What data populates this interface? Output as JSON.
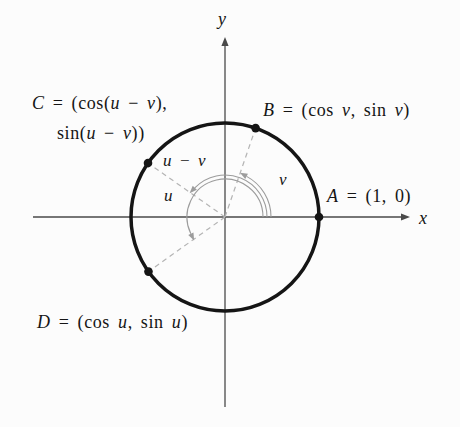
{
  "figure": {
    "colors": {
      "background": "#fcfcfc",
      "ink": "#151515",
      "axis": "#4a4a4a",
      "dash": "#b4b4b4",
      "arc": "#9c9c9c"
    },
    "geometry": {
      "cx": 225,
      "cy": 217,
      "radius": 94,
      "circle_stroke": 3.5,
      "dot_radius": 4.3,
      "axes": {
        "x_from": 33,
        "x_to": 410,
        "y_from": 407,
        "y_to": 37
      },
      "points": [
        {
          "name": "A",
          "angle_deg": 0
        },
        {
          "name": "B",
          "angle_deg": 71
        },
        {
          "name": "C",
          "angle_deg": 145
        },
        {
          "name": "D",
          "angle_deg": 215.5
        }
      ],
      "dashed_radii_deg": [
        71,
        145,
        215.5
      ],
      "arcs": [
        {
          "name": "angle-u-arc",
          "r": 38,
          "from_deg": 0,
          "to_deg": 206
        },
        {
          "name": "angle-u-minus-v-arc",
          "r": 42,
          "from_deg": 0,
          "to_deg": 136
        },
        {
          "name": "angle-v-arc",
          "r": 46,
          "from_deg": 0,
          "to_deg": 62
        }
      ]
    },
    "labels": {
      "c_line1": [
        {
          "t": "C",
          "i": true
        },
        {
          "t": " = (cos(",
          "i": false
        },
        {
          "t": "u",
          "i": true
        },
        {
          "t": " − ",
          "i": false
        },
        {
          "t": "v",
          "i": true
        },
        {
          "t": "),",
          "i": false
        }
      ],
      "c_line2": [
        {
          "t": "sin(",
          "i": false
        },
        {
          "t": "u",
          "i": true
        },
        {
          "t": " − ",
          "i": false
        },
        {
          "t": "v",
          "i": true
        },
        {
          "t": "))",
          "i": false
        }
      ],
      "b": [
        {
          "t": "B",
          "i": true
        },
        {
          "t": " = (cos ",
          "i": false
        },
        {
          "t": "v",
          "i": true
        },
        {
          "t": ", sin ",
          "i": false
        },
        {
          "t": "v",
          "i": true
        },
        {
          "t": ")",
          "i": false
        }
      ],
      "a": [
        {
          "t": "A",
          "i": true
        },
        {
          "t": " = (1, 0)",
          "i": false
        }
      ],
      "d": [
        {
          "t": "D",
          "i": true
        },
        {
          "t": " = (cos ",
          "i": false
        },
        {
          "t": "u",
          "i": true
        },
        {
          "t": ", sin ",
          "i": false
        },
        {
          "t": "u",
          "i": true
        },
        {
          "t": ")",
          "i": false
        }
      ],
      "u_minus_v": [
        {
          "t": "u",
          "i": true
        },
        {
          "t": " − ",
          "i": false
        },
        {
          "t": "v",
          "i": true
        }
      ],
      "u": [
        {
          "t": "u",
          "i": true
        }
      ],
      "v": [
        {
          "t": "v",
          "i": true
        }
      ],
      "x_axis": [
        {
          "t": "x",
          "i": true
        }
      ],
      "y_axis": [
        {
          "t": "y",
          "i": true
        }
      ]
    }
  }
}
